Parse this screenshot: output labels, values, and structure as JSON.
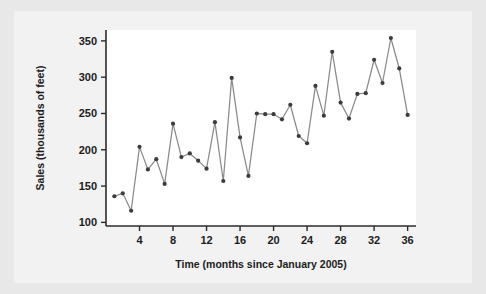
{
  "figure": {
    "background_color": "#e8e8e8",
    "panel_color": "#f2f2f2",
    "plot_background": "#ffffff"
  },
  "chart_data": {
    "type": "line",
    "title": "",
    "xlabel": "Time (months since January 2005)",
    "ylabel": "Sales (thousands of feet)",
    "xlim": [
      0,
      37
    ],
    "ylim": [
      95,
      365
    ],
    "grid": false,
    "legend": null,
    "xticks": [
      4,
      8,
      12,
      16,
      20,
      24,
      28,
      32,
      36
    ],
    "xtick_labels": [
      "4",
      "8",
      "12",
      "16",
      "20",
      "24",
      "28",
      "32",
      "36"
    ],
    "yticks": [
      100,
      150,
      200,
      250,
      300,
      350
    ],
    "ytick_labels": [
      "100",
      "150",
      "200",
      "250",
      "300",
      "350"
    ],
    "marker": "circle",
    "marker_color": "#3c3c3c",
    "line_color": "#8a8a8a",
    "x": [
      1,
      2,
      3,
      4,
      5,
      6,
      7,
      8,
      9,
      10,
      11,
      12,
      13,
      14,
      15,
      16,
      17,
      18,
      19,
      20,
      21,
      22,
      23,
      24,
      25,
      26,
      27,
      28,
      29,
      30,
      31,
      32,
      33,
      34,
      35,
      36
    ],
    "values": [
      136,
      140,
      116,
      204,
      173,
      187,
      153,
      236,
      190,
      195,
      185,
      174,
      238,
      157,
      299,
      217,
      164,
      250,
      249,
      249,
      242,
      262,
      219,
      209,
      288,
      247,
      335,
      265,
      243,
      277,
      278,
      324,
      292,
      354,
      312,
      248
    ],
    "series": [
      {
        "name": "Sales",
        "values": [
          136,
          140,
          116,
          204,
          173,
          187,
          153,
          236,
          190,
          195,
          185,
          174,
          238,
          157,
          299,
          217,
          164,
          250,
          249,
          249,
          242,
          262,
          219,
          209,
          288,
          247,
          335,
          265,
          243,
          277,
          278,
          324,
          292,
          354,
          312,
          248
        ]
      }
    ]
  }
}
